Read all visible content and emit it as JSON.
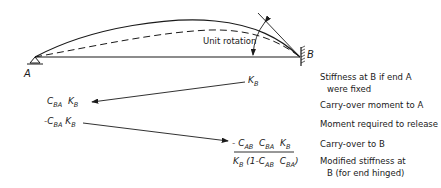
{
  "diagram": {
    "beam": {
      "left_support_label": "A",
      "right_support_label": "B",
      "rotation_label": "Unit rotation"
    },
    "steps": [
      {
        "expression": "K_B",
        "description_line1": "Stiffness at B if end A",
        "description_line2": "were fixed"
      },
      {
        "expression": "C_BA K_B",
        "description_line1": "Carry-over moment to A"
      },
      {
        "expression": "-C_BA K_B",
        "description_line1": "Moment required to release"
      },
      {
        "expression": "-C_AB C_BA K_B",
        "description_line1": "Carry-over to B"
      },
      {
        "expression": "K_B (1 - C_AB C_BA)",
        "description_line1": "Modified stiffness at",
        "description_line2": "B (for end hinged)"
      }
    ],
    "math_parts": {
      "K": "K",
      "B": "B",
      "C": "C",
      "BA": "BA",
      "AB": "AB",
      "minus": "-",
      "one_minus": "(1-",
      "close": ")"
    }
  }
}
